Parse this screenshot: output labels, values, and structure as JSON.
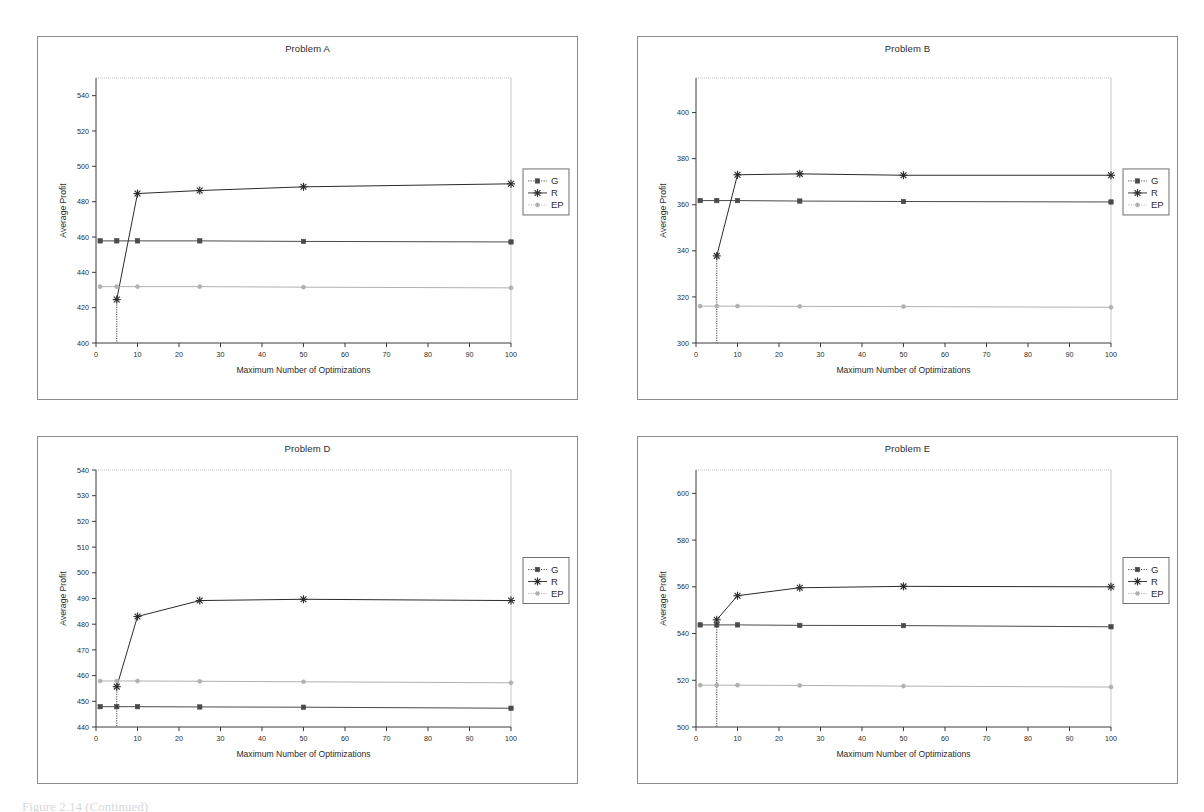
{
  "document": {
    "caption": "Figure 2.14 (Continued)"
  },
  "common": {
    "xlabel": "Maximum Number of Optimizations",
    "ylabel": "Average Profit",
    "x_ticks": [
      0,
      10,
      20,
      30,
      40,
      50,
      60,
      70,
      80,
      90,
      100
    ],
    "x": [
      1,
      5,
      10,
      25,
      50,
      100
    ],
    "legend": [
      {
        "name": "G",
        "marker": "square",
        "color": "#4a4a4a"
      },
      {
        "name": "R",
        "marker": "asterisk",
        "color": "#2b2b2b"
      },
      {
        "name": "EP",
        "marker": "circle",
        "color": "#b0b0b0"
      }
    ],
    "colors": {
      "series_g": "#4a4a4a",
      "series_r": "#2b2b2b",
      "series_ep": "#b0b0b0",
      "axis": "#3a3a3a",
      "frame": "#8c8c8c",
      "gridline": "#c8c8c8"
    }
  },
  "chart_data": [
    {
      "id": "problem-a",
      "type": "line",
      "title": "Problem A",
      "xlabel": "Maximum Number of Optimizations",
      "ylabel": "Average Profit",
      "x": [
        1,
        5,
        10,
        25,
        50,
        100
      ],
      "xlim": [
        0,
        100
      ],
      "ylim": [
        400,
        550
      ],
      "y_ticks": [
        400,
        420,
        440,
        460,
        480,
        500,
        520,
        540
      ],
      "grid": false,
      "legend_position": "right",
      "series": [
        {
          "name": "G",
          "values": [
            457.8,
            457.8,
            457.8,
            457.8,
            457.5,
            457.2
          ]
        },
        {
          "name": "R",
          "values": [
            null,
            424.6,
            484.6,
            486.3,
            488.4,
            490.1
          ]
        },
        {
          "name": "EP",
          "values": [
            431.9,
            431.9,
            431.9,
            431.9,
            431.6,
            431.2
          ]
        }
      ]
    },
    {
      "id": "problem-b",
      "type": "line",
      "title": "Problem B",
      "xlabel": "Maximum Number of Optimizations",
      "ylabel": "Average Profit",
      "x": [
        1,
        5,
        10,
        25,
        50,
        100
      ],
      "xlim": [
        0,
        100
      ],
      "ylim": [
        300,
        415
      ],
      "y_ticks": [
        300,
        320,
        340,
        360,
        380,
        400
      ],
      "grid": false,
      "legend_position": "right",
      "series": [
        {
          "name": "G",
          "values": [
            361.8,
            361.8,
            361.8,
            361.6,
            361.4,
            361.2
          ]
        },
        {
          "name": "R",
          "values": [
            null,
            337.8,
            373.0,
            373.4,
            372.8,
            372.8
          ]
        },
        {
          "name": "EP",
          "values": [
            316.0,
            316.0,
            316.0,
            315.9,
            315.8,
            315.5
          ]
        }
      ]
    },
    {
      "id": "problem-d",
      "type": "line",
      "title": "Problem D",
      "xlabel": "Maximum Number of Optimizations",
      "ylabel": "Average Profit",
      "x": [
        1,
        5,
        10,
        25,
        50,
        100
      ],
      "xlim": [
        0,
        100
      ],
      "ylim": [
        440,
        540
      ],
      "y_ticks": [
        440,
        450,
        460,
        470,
        480,
        490,
        500,
        510,
        520,
        530,
        540
      ],
      "grid": false,
      "legend_position": "right",
      "series": [
        {
          "name": "G",
          "values": [
            447.9,
            447.9,
            447.9,
            447.8,
            447.7,
            447.3
          ]
        },
        {
          "name": "R",
          "values": [
            null,
            455.7,
            483.0,
            489.2,
            489.7,
            489.2
          ]
        },
        {
          "name": "EP",
          "values": [
            457.9,
            457.9,
            457.9,
            457.8,
            457.6,
            457.2
          ]
        }
      ]
    },
    {
      "id": "problem-e",
      "type": "line",
      "title": "Problem E",
      "xlabel": "Maximum Number of Optimizations",
      "ylabel": "Average Profit",
      "x": [
        1,
        5,
        10,
        25,
        50,
        100
      ],
      "xlim": [
        0,
        100
      ],
      "ylim": [
        500,
        610
      ],
      "y_ticks": [
        500,
        520,
        540,
        560,
        580,
        600
      ],
      "grid": false,
      "legend_position": "right",
      "series": [
        {
          "name": "G",
          "values": [
            543.7,
            543.7,
            543.7,
            543.5,
            543.4,
            542.9
          ]
        },
        {
          "name": "R",
          "values": [
            null,
            545.9,
            556.2,
            559.6,
            560.2,
            560.0
          ]
        },
        {
          "name": "EP",
          "values": [
            517.9,
            517.9,
            517.9,
            517.8,
            517.5,
            517.1
          ]
        }
      ]
    }
  ]
}
